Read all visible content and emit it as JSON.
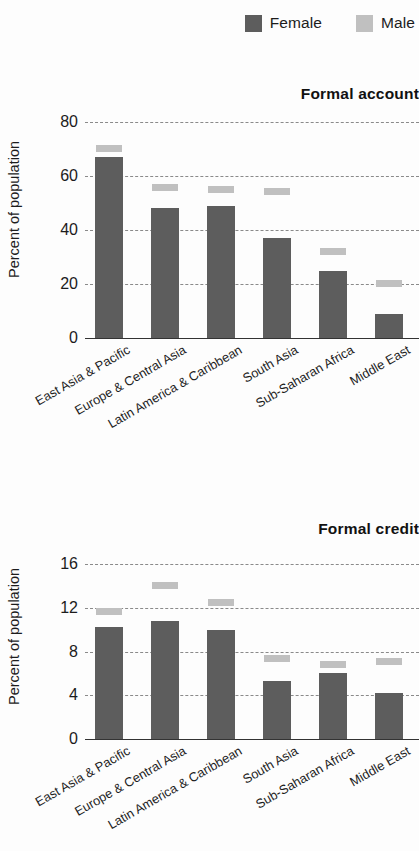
{
  "legend": {
    "entries": [
      {
        "label": "Female",
        "color": "#5d5d5d",
        "swatch_name": "legend-swatch-female"
      },
      {
        "label": "Male",
        "color": "#c0c0c0",
        "swatch_name": "legend-swatch-male"
      }
    ]
  },
  "colors": {
    "female": "#5d5d5d",
    "male": "#c0c0c0",
    "gridline": "#8a8a8a",
    "axis": "#333333",
    "text": "#1c1c1c",
    "background": "#fdfdfd"
  },
  "chart_data": [
    {
      "type": "bar",
      "title": "Formal account",
      "xlabel": "",
      "ylabel": "Percent of population",
      "ylim": [
        0,
        80
      ],
      "yticks": [
        0,
        20,
        40,
        60,
        80
      ],
      "ytick_labels": [
        "0",
        "20",
        "40",
        "60",
        "80"
      ],
      "grid": true,
      "legend_position": "top-right",
      "categories": [
        "East Asia & Pacific",
        "Europe & Central Asia",
        "Latin America & Caribbean",
        "South Asia",
        "Sub-Saharan Africa",
        "Middle East"
      ],
      "series": [
        {
          "name": "Female",
          "style": "bar",
          "values": [
            67,
            48,
            49,
            37,
            25,
            9
          ]
        },
        {
          "name": "Male",
          "style": "marker",
          "values": [
            70,
            55.5,
            55,
            54,
            32,
            20
          ]
        }
      ]
    },
    {
      "type": "bar",
      "title": "Formal credit",
      "xlabel": "",
      "ylabel": "Percent of population",
      "ylim": [
        0,
        16
      ],
      "yticks": [
        0,
        4,
        8,
        12,
        16
      ],
      "ytick_labels": [
        "0",
        "4",
        "8",
        "12",
        "16"
      ],
      "grid": true,
      "legend_position": "top-right",
      "categories": [
        "East Asia & Pacific",
        "Europe & Central Asia",
        "Latin America & Caribbean",
        "South Asia",
        "Sub-Saharan Africa",
        "Middle East"
      ],
      "series": [
        {
          "name": "Female",
          "style": "bar",
          "values": [
            10.2,
            10.8,
            10.0,
            5.3,
            6.0,
            4.2
          ]
        },
        {
          "name": "Male",
          "style": "marker",
          "values": [
            11.6,
            14.0,
            12.4,
            7.3,
            6.8,
            7.0
          ]
        }
      ]
    }
  ]
}
